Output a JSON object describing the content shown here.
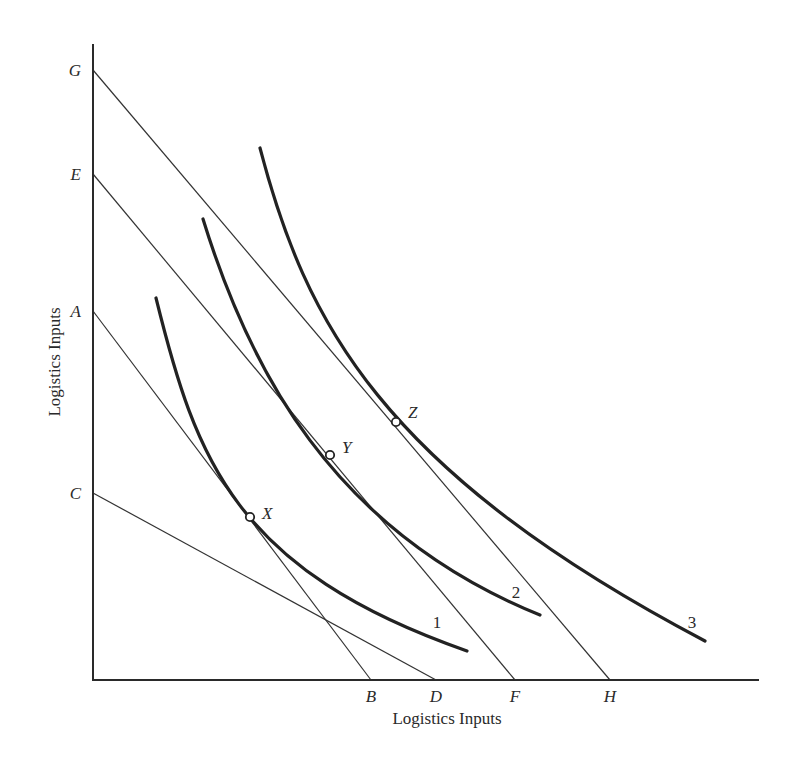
{
  "figure": {
    "type": "isoquant-isocost diagram",
    "x_axis_title": "Logistics Inputs",
    "y_axis_title": "Logistics Inputs",
    "colors": {
      "ink": "#222222",
      "background": "#ffffff"
    }
  },
  "axes": {
    "origin": [
      93,
      680
    ],
    "y_top": 44,
    "x_right": 759
  },
  "y_intercepts": [
    {
      "label": "G",
      "y": 70
    },
    {
      "label": "E",
      "y": 174
    },
    {
      "label": "A",
      "y": 311
    },
    {
      "label": "C",
      "y": 493
    }
  ],
  "x_intercepts": [
    {
      "label": "B",
      "x": 371
    },
    {
      "label": "D",
      "x": 436
    },
    {
      "label": "F",
      "x": 515
    },
    {
      "label": "H",
      "x": 610
    }
  ],
  "isocost_lines": [
    {
      "name": "AB",
      "from": "A",
      "to": "B"
    },
    {
      "name": "CD",
      "from": "C",
      "to": "D"
    },
    {
      "name": "EF",
      "from": "E",
      "to": "F"
    },
    {
      "name": "GH",
      "from": "G",
      "to": "H"
    }
  ],
  "isoquants": [
    {
      "label": "1",
      "path": "M156,298 C196,460 235,570 467,651",
      "label_pos": [
        437,
        628
      ]
    },
    {
      "label": "2",
      "path": "M203,219 C248,365 330,530 540,615",
      "label_pos": [
        516,
        598
      ]
    },
    {
      "label": "3",
      "path": "M260,148 C305,320 380,470 705,641",
      "label_pos": [
        692,
        628
      ]
    }
  ],
  "tangency_points": [
    {
      "label": "X",
      "x": 250,
      "y": 517,
      "label_dx": 12,
      "label_dy": 0
    },
    {
      "label": "Y",
      "x": 330,
      "y": 455,
      "label_dx": 12,
      "label_dy": -4
    },
    {
      "label": "Z",
      "x": 396,
      "y": 422,
      "label_dx": 12,
      "label_dy": -6
    }
  ]
}
